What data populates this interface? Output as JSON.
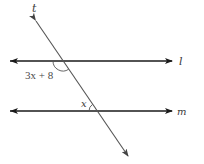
{
  "diagram": {
    "type": "parallel-lines-transversal",
    "lines": {
      "l": {
        "label": "l",
        "y": 61,
        "x1": 10,
        "x2": 172
      },
      "m": {
        "label": "m",
        "y": 111,
        "x1": 10,
        "x2": 172
      },
      "t": {
        "label": "t",
        "x1": 36,
        "y1": 21,
        "x2": 128,
        "y2": 156
      }
    },
    "angles": [
      {
        "name": "angle-at-l",
        "label": "3x + 8",
        "vertex": [
          63,
          61
        ],
        "position": "below-left"
      },
      {
        "name": "angle-at-m",
        "label": "x",
        "vertex": [
          97,
          111
        ],
        "position": "above-left"
      }
    ],
    "colors": {
      "parallel_lines": "#1a1a1a",
      "transversal": "#555555",
      "text": "#3a3a3a"
    }
  }
}
